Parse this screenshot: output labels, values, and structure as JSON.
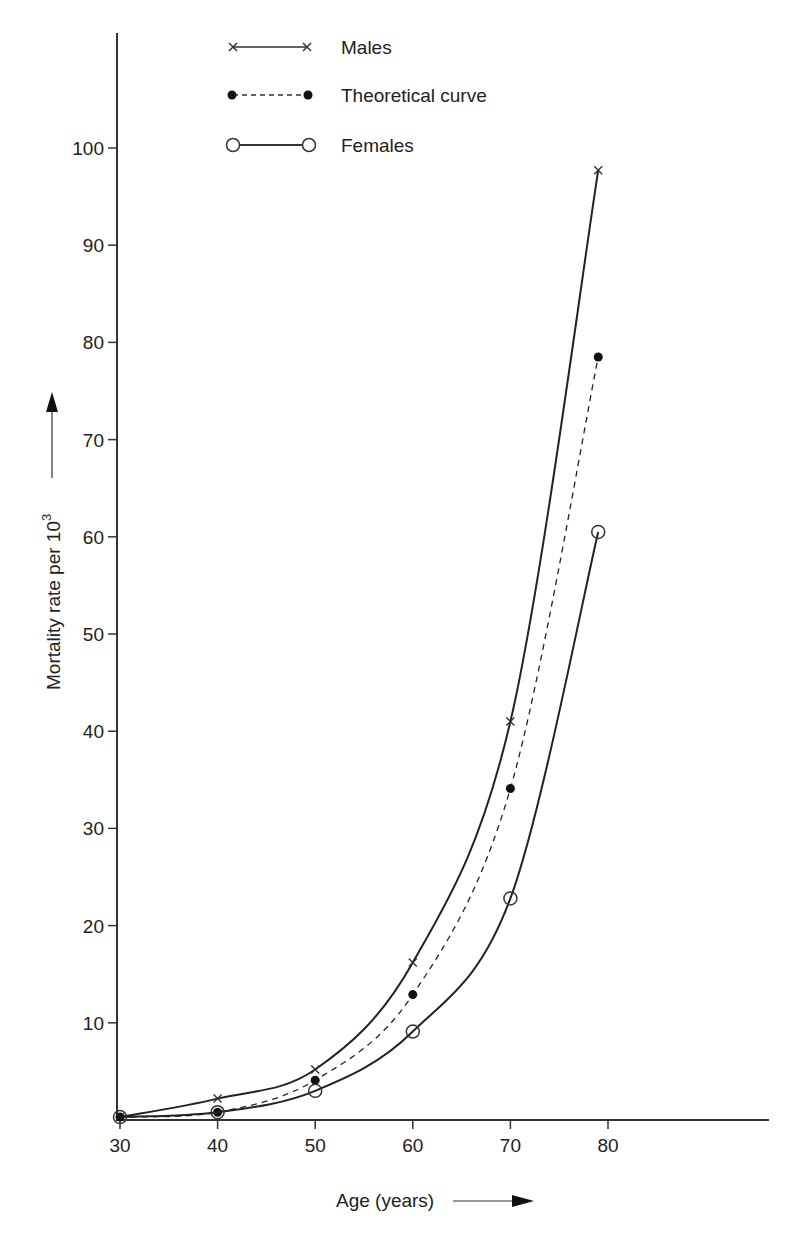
{
  "chart_data": {
    "type": "line",
    "title": "",
    "xlabel": "Age (years)",
    "ylabel": "Mortality rate per 10^3",
    "ylabel_base": "Mortality rate per 10",
    "ylabel_exp": "3",
    "x": [
      30,
      40,
      50,
      60,
      70,
      79
    ],
    "xticks": [
      30,
      40,
      50,
      60,
      70,
      80
    ],
    "yticks": [
      10,
      20,
      30,
      40,
      50,
      60,
      70,
      80,
      90,
      100
    ],
    "xlim": [
      30,
      80
    ],
    "ylim": [
      0,
      100
    ],
    "grid": false,
    "legend_position": "top-center",
    "series": [
      {
        "name": "Males",
        "marker": "x",
        "line": "solid",
        "values": [
          0.3,
          2.2,
          5.2,
          16.2,
          41.0,
          97.7
        ]
      },
      {
        "name": "Theoretical curve",
        "marker": "filled-circle",
        "line": "dashed",
        "values": [
          0.3,
          0.8,
          4.1,
          12.9,
          34.1,
          78.5
        ]
      },
      {
        "name": "Females",
        "marker": "open-circle",
        "line": "solid",
        "values": [
          0.3,
          0.8,
          3.0,
          9.1,
          22.8,
          60.5
        ]
      }
    ]
  },
  "legend": {
    "males": "Males",
    "theoretical": "Theoretical curve",
    "females": "Females"
  },
  "axes": {
    "x_title": "Age (years)",
    "y_title": "Mortality rate per 10",
    "y_title_exp": "3"
  },
  "colors": {
    "ink": "#222222",
    "background": "#ffffff"
  }
}
